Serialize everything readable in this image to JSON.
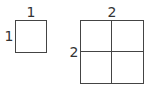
{
  "small_square": {
    "top_label": "1",
    "side_label": "1"
  },
  "large_square": {
    "top_label": "2",
    "side_label": "2",
    "grid": "2x2"
  }
}
